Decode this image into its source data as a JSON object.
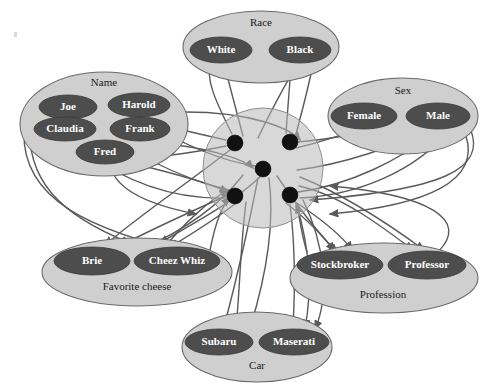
{
  "diagram": {
    "background_color": "#ffffff",
    "group_fill": "#cfcfcf",
    "value_fill": "#4d4d4d",
    "value_text_color": "#ffffff",
    "hub_fill": "#b8b8b8",
    "hub_dot_color": "#111111",
    "edge_color": "#5a5a5a"
  },
  "hub": {
    "label": "hidden-node-cluster",
    "cx": 263,
    "cy": 168,
    "r": 60,
    "dots": [
      {
        "name": "hidden-node-1",
        "cx": 235,
        "cy": 143,
        "r": 8
      },
      {
        "name": "hidden-node-2",
        "cx": 290,
        "cy": 142,
        "r": 8
      },
      {
        "name": "hidden-node-3",
        "cx": 263,
        "cy": 169,
        "r": 8
      },
      {
        "name": "hidden-node-4",
        "cx": 235,
        "cy": 196,
        "r": 8
      },
      {
        "name": "hidden-node-5",
        "cx": 290,
        "cy": 195,
        "r": 8
      }
    ]
  },
  "groups": [
    {
      "id": "race",
      "label": "Race",
      "label_x": 261,
      "label_y": 26,
      "cx": 261,
      "cy": 47,
      "rx": 78,
      "ry": 36,
      "values": [
        {
          "id": "white",
          "label": "White",
          "cx": 221,
          "cy": 50,
          "rx": 31,
          "ry": 13
        },
        {
          "id": "black",
          "label": "Black",
          "cx": 300,
          "cy": 50,
          "rx": 31,
          "ry": 13
        }
      ]
    },
    {
      "id": "name",
      "label": "Name",
      "label_x": 104,
      "label_y": 86,
      "cx": 104,
      "cy": 124,
      "rx": 84,
      "ry": 52,
      "values": [
        {
          "id": "joe",
          "label": "Joe",
          "cx": 68,
          "cy": 107,
          "rx": 29,
          "ry": 12
        },
        {
          "id": "harold",
          "label": "Harold",
          "cx": 139,
          "cy": 105,
          "rx": 31,
          "ry": 12
        },
        {
          "id": "claudia",
          "label": "Claudia",
          "cx": 65,
          "cy": 129,
          "rx": 31,
          "ry": 12
        },
        {
          "id": "frank",
          "label": "Frank",
          "cx": 140,
          "cy": 129,
          "rx": 30,
          "ry": 12
        },
        {
          "id": "fred",
          "label": "Fred",
          "cx": 105,
          "cy": 152,
          "rx": 29,
          "ry": 12
        }
      ]
    },
    {
      "id": "sex",
      "label": "Sex",
      "label_x": 403,
      "label_y": 94,
      "cx": 403,
      "cy": 116,
      "rx": 75,
      "ry": 38,
      "values": [
        {
          "id": "female",
          "label": "Female",
          "cx": 364,
          "cy": 116,
          "rx": 33,
          "ry": 13
        },
        {
          "id": "male",
          "label": "Male",
          "cx": 438,
          "cy": 116,
          "rx": 32,
          "ry": 13
        }
      ]
    },
    {
      "id": "favorite-cheese",
      "label": "Favorite cheese",
      "label_x": 137,
      "label_y": 290,
      "cx": 137,
      "cy": 272,
      "rx": 95,
      "ry": 34,
      "values": [
        {
          "id": "brie",
          "label": "Brie",
          "cx": 92,
          "cy": 261,
          "rx": 38,
          "ry": 14
        },
        {
          "id": "cheez-whiz",
          "label": "Cheez Whiz",
          "cx": 177,
          "cy": 261,
          "rx": 43,
          "ry": 14
        }
      ]
    },
    {
      "id": "profession",
      "label": "Profession",
      "label_x": 383,
      "label_y": 298,
      "cx": 384,
      "cy": 278,
      "rx": 94,
      "ry": 35,
      "values": [
        {
          "id": "stockbroker",
          "label": "Stockbroker",
          "cx": 340,
          "cy": 265,
          "rx": 43,
          "ry": 14
        },
        {
          "id": "professor",
          "label": "Professor",
          "cx": 427,
          "cy": 265,
          "rx": 39,
          "ry": 14
        }
      ]
    },
    {
      "id": "car",
      "label": "Car",
      "label_x": 257,
      "label_y": 369,
      "cx": 257,
      "cy": 347,
      "rx": 75,
      "ry": 35,
      "values": [
        {
          "id": "subaru",
          "label": "Subaru",
          "cx": 219,
          "cy": 342,
          "rx": 34,
          "ry": 13
        },
        {
          "id": "maserati",
          "label": "Maserati",
          "cx": 294,
          "cy": 342,
          "rx": 35,
          "ry": 13
        }
      ]
    }
  ],
  "edges": [
    {
      "id": "e1",
      "d": "M 232,134 C 215,100 205,78 211,63"
    },
    {
      "id": "e2",
      "d": "M 243,136 C 235,105 228,80 224,64"
    },
    {
      "id": "e3",
      "d": "M 258,138 C 272,108 288,80 297,64"
    },
    {
      "id": "e4",
      "d": "M 286,133 C 288,105 290,82 291,64"
    },
    {
      "id": "e5",
      "d": "M 296,134 C 304,104 310,80 313,64"
    },
    {
      "id": "e6",
      "d": "M 226,140 C 190,132 160,125 137,118"
    },
    {
      "id": "e7",
      "d": "M 226,146 C 196,152 170,156 150,157"
    },
    {
      "id": "e8",
      "d": "M 255,166 C 215,160 175,140 140,119"
    },
    {
      "id": "e9",
      "d": "M 229,190 C 180,178 120,150 97,120"
    },
    {
      "id": "e10",
      "d": "M 228,198 C 170,200 120,178 82,150"
    },
    {
      "id": "e11",
      "d": "M 260,177 C 230,205 190,225 160,243"
    },
    {
      "id": "e12",
      "d": "M 240,200 C 215,220 190,235 170,247"
    },
    {
      "id": "e13",
      "d": "M 228,195 C 190,212 150,230 120,246"
    },
    {
      "id": "e14",
      "d": "M 230,150 C 185,185 140,215 105,245"
    },
    {
      "id": "e15",
      "d": "M 243,175 C 220,205 185,230 140,250"
    },
    {
      "id": "e16",
      "d": "M 296,148 C 330,140 360,128 382,122"
    },
    {
      "id": "e17",
      "d": "M 298,142 C 340,138 380,130 408,126"
    },
    {
      "id": "e18",
      "d": "M 297,170 C 345,164 395,146 428,130"
    },
    {
      "id": "e19",
      "d": "M 298,192 C 350,185 400,160 436,131"
    },
    {
      "id": "e20",
      "d": "M 300,198 C 360,195 415,170 448,132"
    },
    {
      "id": "e21",
      "d": "M 299,186 C 340,195 380,225 413,250"
    },
    {
      "id": "e22",
      "d": "M 300,177 C 345,195 390,225 424,250"
    },
    {
      "id": "e23",
      "d": "M 297,203 C 330,225 345,240 352,250"
    },
    {
      "id": "e24",
      "d": "M 286,203 C 310,222 325,238 334,251"
    },
    {
      "id": "e25",
      "d": "M 277,176 C 300,210 320,235 337,252"
    },
    {
      "id": "e26",
      "d": "M 269,178 C 275,225 265,280 250,328"
    },
    {
      "id": "e27",
      "d": "M 258,178 C 248,230 235,285 224,327"
    },
    {
      "id": "e28",
      "d": "M 246,202 C 240,250 240,290 236,327"
    },
    {
      "id": "e29",
      "d": "M 290,205 C 296,250 295,290 293,328"
    },
    {
      "id": "e30",
      "d": "M 297,206 C 310,250 312,292 305,328"
    },
    {
      "id": "e31",
      "d": "M 303,200 C 325,245 330,295 315,329"
    },
    {
      "id": "e32",
      "d": "M 30,120 C 25,180 60,215 130,243"
    },
    {
      "id": "e33",
      "d": "M 24,132 C 22,200 90,230 195,255"
    },
    {
      "id": "e34",
      "d": "M 186,112 C 250,112 290,128 300,140"
    },
    {
      "id": "e35",
      "d": "M 176,145 C 215,150 245,160 253,168"
    },
    {
      "id": "e36",
      "d": "M 135,164 C 185,176 215,186 228,192"
    },
    {
      "id": "e37",
      "d": "M 110,162 C 112,190 150,205 196,214"
    },
    {
      "id": "e38",
      "d": "M 466,136 C 480,180 430,205 330,214"
    },
    {
      "id": "e39",
      "d": "M 470,128 C 488,170 440,190 310,200"
    },
    {
      "id": "e40",
      "d": "M 438,252 C 470,220 430,195 330,186"
    },
    {
      "id": "e41",
      "d": "M 307,252 C 300,230 300,215 296,205"
    },
    {
      "id": "e42",
      "d": "M 210,250 C 215,225 222,205 230,198"
    },
    {
      "id": "e43",
      "d": "M 163,249 C 185,222 210,200 228,190"
    }
  ],
  "arrow_count": 43
}
